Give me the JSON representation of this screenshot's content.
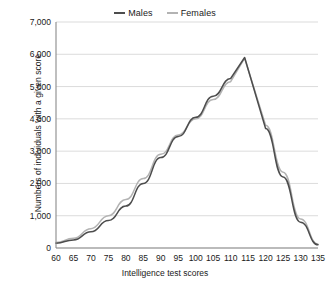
{
  "chart_data": {
    "type": "line",
    "title": "",
    "xlabel": "Intelligence test scores",
    "ylabel": "Numbers of individuals with a given score",
    "xlim": [
      60,
      135
    ],
    "ylim": [
      0,
      7000
    ],
    "xticks": [
      60,
      65,
      70,
      75,
      80,
      85,
      90,
      95,
      100,
      105,
      110,
      115,
      120,
      125,
      130,
      135
    ],
    "yticks": [
      0,
      1000,
      2000,
      3000,
      4000,
      5000,
      6000,
      7000
    ],
    "ytick_labels": [
      "0",
      "1,000",
      "2,000",
      "3,000",
      "4,000",
      "5,000",
      "6,000",
      "7,000"
    ],
    "xtick_labels": [
      "60",
      "65",
      "70",
      "75",
      "80",
      "85",
      "90",
      "95",
      "100",
      "105",
      "110",
      "115",
      "120",
      "125",
      "130",
      "135"
    ],
    "grid": "horizontal",
    "legend_position": "top-center",
    "x": [
      60,
      65,
      70,
      75,
      80,
      85,
      90,
      95,
      100,
      105,
      110,
      114,
      120,
      125,
      130,
      135
    ],
    "series": [
      {
        "name": "Males",
        "color": "#4d4d4d",
        "values": [
          150,
          250,
          500,
          850,
          1300,
          2000,
          2800,
          3450,
          4050,
          4700,
          5250,
          5900,
          3700,
          2200,
          800,
          100
        ]
      },
      {
        "name": "Females",
        "color": "#b3b3b3",
        "values": [
          170,
          300,
          600,
          1000,
          1500,
          2150,
          2900,
          3500,
          4000,
          4600,
          5150,
          5880,
          3800,
          2350,
          900,
          120
        ]
      }
    ]
  },
  "legend": {
    "entries": [
      {
        "label": "Males",
        "color": "#4d4d4d"
      },
      {
        "label": "Females",
        "color": "#b3b3b3"
      }
    ]
  },
  "axes": {
    "x_title": "Intelligence test scores",
    "y_title": "Numbers of individuals with a given score"
  }
}
